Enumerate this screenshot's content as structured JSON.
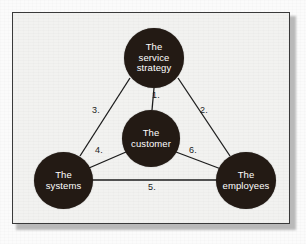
{
  "figure": {
    "frame": {
      "border_color": "#3a3a3a",
      "background_color": "#f2f2f0"
    },
    "node_color": "#231a14",
    "node_text_color": "#ffffff",
    "edge_color": "#1c1c1c"
  },
  "nodes": [
    {
      "id": "service-strategy",
      "lines": [
        "The",
        "service",
        "strategy"
      ],
      "position": "top"
    },
    {
      "id": "customer",
      "lines": [
        "The",
        "customer"
      ],
      "position": "center"
    },
    {
      "id": "systems",
      "lines": [
        "The",
        "systems"
      ],
      "position": "bottom-left"
    },
    {
      "id": "employees",
      "lines": [
        "The",
        "employees"
      ],
      "position": "bottom-right"
    }
  ],
  "edges": [
    {
      "id": "edge-1",
      "label": "1.",
      "from": "service-strategy",
      "to": "customer"
    },
    {
      "id": "edge-2",
      "label": "2.",
      "from": "service-strategy",
      "to": "employees"
    },
    {
      "id": "edge-3",
      "label": "3.",
      "from": "service-strategy",
      "to": "systems"
    },
    {
      "id": "edge-4",
      "label": "4.",
      "from": "systems",
      "to": "customer"
    },
    {
      "id": "edge-5",
      "label": "5.",
      "from": "systems",
      "to": "employees"
    },
    {
      "id": "edge-6",
      "label": "6.",
      "from": "customer",
      "to": "employees"
    }
  ]
}
